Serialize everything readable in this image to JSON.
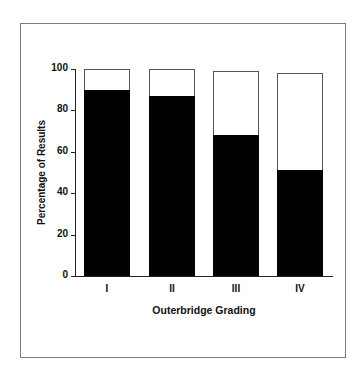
{
  "chart_data": {
    "type": "bar",
    "stacked": true,
    "title": "",
    "xlabel": "Outerbridge Grading",
    "ylabel": "Percentage of Results",
    "ylim": [
      0,
      100
    ],
    "yticks": [
      0,
      20,
      40,
      60,
      80,
      100
    ],
    "categories": [
      "I",
      "II",
      "III",
      "IV"
    ],
    "series": [
      {
        "name": "Black (lower segment)",
        "color": "#000000",
        "values": [
          90,
          87,
          68,
          51
        ]
      },
      {
        "name": "White (upper segment)",
        "color": "#ffffff",
        "values": [
          10,
          13,
          31,
          47
        ]
      }
    ],
    "totals": [
      100,
      100,
      99,
      98
    ],
    "grid": false,
    "legend": null
  },
  "axis": {
    "y_tick_labels": [
      "0",
      "20",
      "40",
      "60",
      "80",
      "100"
    ],
    "x_tick_labels": [
      "I",
      "II",
      "III",
      "IV"
    ]
  },
  "colors": {
    "filled": "#000000",
    "unfilled": "#ffffff",
    "frame": "#7a7a7a"
  }
}
